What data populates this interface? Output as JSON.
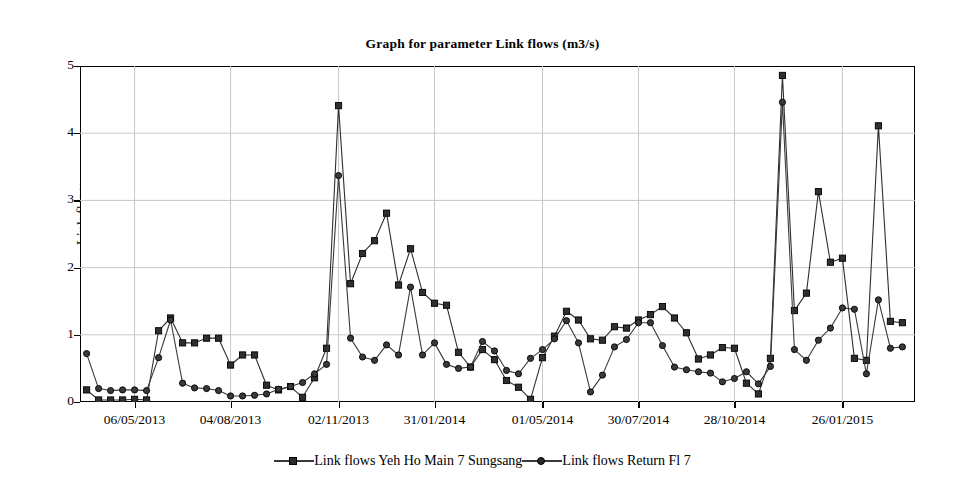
{
  "chart_data": {
    "type": "line",
    "title": "Graph for parameter Link flows (m3/s)",
    "xlabel": "",
    "ylabel": "Link flows",
    "ylim": [
      0,
      5
    ],
    "yticks": [
      0,
      1,
      2,
      3,
      4,
      5
    ],
    "grid": true,
    "legend_position": "bottom",
    "x_tick_labels": [
      "06/05/2013",
      "04/08/2013",
      "02/11/2013",
      "31/01/2014",
      "01/05/2014",
      "30/07/2014",
      "28/10/2014",
      "26/01/2015"
    ],
    "x_tick_indices": [
      4,
      12,
      21,
      29,
      38,
      46,
      54,
      63
    ],
    "x_start_label": "06/05/2013",
    "x_interval_days": 11,
    "n_points": 69,
    "series": [
      {
        "name": "Link flows Yeh Ho Main 7 Sungsang",
        "marker": "square",
        "color": "#2f2f2f",
        "values": [
          0.18,
          0.03,
          0.03,
          0.03,
          0.04,
          0.03,
          1.06,
          1.25,
          0.88,
          0.88,
          0.95,
          0.95,
          0.55,
          0.7,
          0.7,
          0.25,
          0.18,
          0.23,
          0.07,
          0.36,
          0.8,
          4.41,
          1.76,
          2.21,
          2.4,
          2.81,
          1.74,
          2.28,
          1.63,
          1.47,
          1.44,
          0.74,
          0.52,
          0.78,
          0.63,
          0.32,
          0.22,
          0.04,
          0.66,
          0.98,
          1.35,
          1.22,
          0.94,
          0.92,
          1.12,
          1.1,
          1.22,
          1.3,
          1.42,
          1.25,
          1.03,
          0.64,
          0.7,
          0.81,
          0.8,
          0.28,
          0.12,
          0.65,
          4.86,
          1.36,
          1.62,
          3.13,
          2.08,
          2.14,
          0.65,
          0.62,
          4.11,
          1.2,
          1.18
        ],
        "min": 0.03,
        "max": 4.86
      },
      {
        "name": "Link flows Return Fl 7",
        "marker": "circle",
        "color": "#3a3a3a",
        "values": [
          0.72,
          0.2,
          0.17,
          0.18,
          0.18,
          0.17,
          0.66,
          1.22,
          0.28,
          0.21,
          0.2,
          0.17,
          0.09,
          0.09,
          0.1,
          0.12,
          0.19,
          0.23,
          0.29,
          0.42,
          0.56,
          3.37,
          0.95,
          0.67,
          0.62,
          0.85,
          0.7,
          1.71,
          0.7,
          0.88,
          0.56,
          0.5,
          0.52,
          0.9,
          0.76,
          0.47,
          0.42,
          0.65,
          0.78,
          0.94,
          1.21,
          0.88,
          0.15,
          0.4,
          0.82,
          0.93,
          1.18,
          1.18,
          0.84,
          0.52,
          0.48,
          0.45,
          0.43,
          0.3,
          0.35,
          0.45,
          0.27,
          0.53,
          4.46,
          0.78,
          0.62,
          0.92,
          1.1,
          1.4,
          1.38,
          0.42,
          1.52,
          0.8,
          0.82
        ],
        "min": 0.09,
        "max": 4.46
      }
    ]
  },
  "legend": {
    "items": [
      {
        "label": "Link flows Yeh Ho Main 7 Sungsang",
        "marker": "square"
      },
      {
        "label": "Link flows Return Fl 7",
        "marker": "circle"
      }
    ]
  },
  "colors": {
    "series_square": "#2f2f2f",
    "series_circle": "#3a3a3a",
    "grid": "#c8c8c8",
    "axis": "#000000",
    "background": "#ffffff"
  }
}
